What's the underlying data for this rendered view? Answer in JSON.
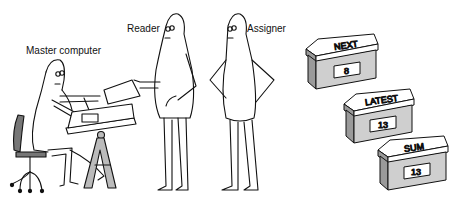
{
  "figures": [
    {
      "id": "master-computer",
      "label": "Master computer"
    },
    {
      "id": "reader",
      "label": "Reader"
    },
    {
      "id": "assigner",
      "label": "Assigner"
    }
  ],
  "boxes": [
    {
      "name": "NEXT",
      "value": "8"
    },
    {
      "name": "LATEST",
      "value": "13"
    },
    {
      "name": "SUM",
      "value": "13"
    }
  ],
  "colors": {
    "line": "#111111",
    "box_side": "#9a9a9a",
    "box_front": "#cfcfcf",
    "chair_seat": "#777777",
    "easel": "#bbbbbb"
  }
}
